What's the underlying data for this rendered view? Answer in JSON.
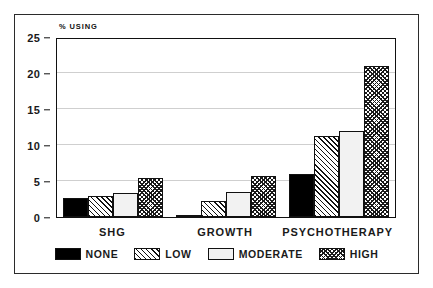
{
  "chart_data": {
    "type": "bar",
    "title": "",
    "subtitle": "",
    "xlabel": "",
    "ylabel": "% USING",
    "ylim": [
      0,
      25
    ],
    "yticks": [
      0,
      5,
      10,
      15,
      20,
      25
    ],
    "ytick_labels": [
      "0",
      "5",
      "10",
      "15",
      "20",
      "25"
    ],
    "grid": true,
    "grid_axis": "y",
    "legend_position": "bottom",
    "categories": [
      "SHG",
      "GROWTH",
      "PSYCHOTHERAPY"
    ],
    "series": [
      {
        "name": "NONE",
        "values": [
          2.6,
          0.3,
          6.0
        ],
        "pattern": "solid-black",
        "color": "#000000"
      },
      {
        "name": "LOW",
        "values": [
          2.9,
          2.2,
          11.2
        ],
        "pattern": "diagonal-hatch",
        "color": "#ffffff"
      },
      {
        "name": "MODERATE",
        "values": [
          3.3,
          3.5,
          12.0
        ],
        "pattern": "blank-white",
        "color": "#f2f2f2"
      },
      {
        "name": "HIGH",
        "values": [
          5.4,
          5.7,
          21.0
        ],
        "pattern": "crosshatch",
        "color": "#ffffff"
      }
    ]
  },
  "legend": {
    "items": [
      {
        "label": "NONE"
      },
      {
        "label": "LOW"
      },
      {
        "label": "MODERATE"
      },
      {
        "label": "HIGH"
      }
    ]
  }
}
